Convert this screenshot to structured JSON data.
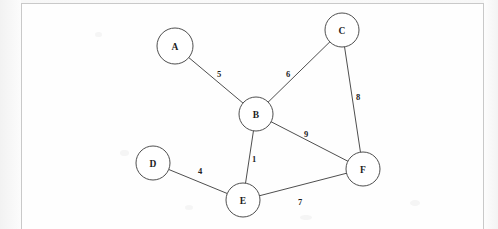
{
  "document": {
    "kind": "scanned-page-graph-diagram",
    "page_background_color": "#fbfbfb",
    "frame_border_color": "#c9c9c9",
    "ink_color": "#3a3a3a",
    "node_fill_color": "#ffffff"
  },
  "graph_data": {
    "type": "node-link-diagram",
    "directed": false,
    "weighted": true,
    "node_radius": 17,
    "nodes": [
      {
        "id": "A",
        "label": "A",
        "x": 175,
        "y": 46,
        "r": 18
      },
      {
        "id": "B",
        "label": "B",
        "x": 256,
        "y": 114,
        "r": 17
      },
      {
        "id": "C",
        "label": "C",
        "x": 342,
        "y": 30,
        "r": 17
      },
      {
        "id": "D",
        "label": "D",
        "x": 153,
        "y": 163,
        "r": 17
      },
      {
        "id": "E",
        "label": "E",
        "x": 243,
        "y": 200,
        "r": 17
      },
      {
        "id": "F",
        "label": "F",
        "x": 363,
        "y": 169,
        "r": 17
      }
    ],
    "edges": [
      {
        "source": "A",
        "target": "B",
        "weight": 5,
        "label": "5",
        "label_x": 219,
        "label_y": 74
      },
      {
        "source": "B",
        "target": "C",
        "weight": 6,
        "label": "6",
        "label_x": 288,
        "label_y": 74
      },
      {
        "source": "C",
        "target": "F",
        "weight": 8,
        "label": "8",
        "label_x": 358,
        "label_y": 97
      },
      {
        "source": "B",
        "target": "F",
        "weight": 9,
        "label": "9",
        "label_x": 306,
        "label_y": 134
      },
      {
        "source": "B",
        "target": "E",
        "weight": 1,
        "label": "1",
        "label_x": 254,
        "label_y": 159
      },
      {
        "source": "D",
        "target": "E",
        "weight": 4,
        "label": "4",
        "label_x": 200,
        "label_y": 171
      },
      {
        "source": "E",
        "target": "F",
        "weight": 7,
        "label": "7",
        "label_x": 300,
        "label_y": 202
      }
    ],
    "adjacency_summary": [
      {
        "node": "A",
        "neighbors": [
          "B"
        ]
      },
      {
        "node": "B",
        "neighbors": [
          "A",
          "C",
          "E",
          "F"
        ]
      },
      {
        "node": "C",
        "neighbors": [
          "B",
          "F"
        ]
      },
      {
        "node": "D",
        "neighbors": [
          "E"
        ]
      },
      {
        "node": "E",
        "neighbors": [
          "B",
          "D",
          "F"
        ]
      },
      {
        "node": "F",
        "neighbors": [
          "B",
          "C",
          "E"
        ]
      }
    ]
  }
}
